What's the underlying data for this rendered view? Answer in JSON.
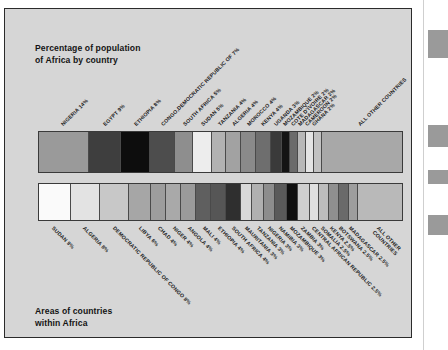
{
  "figure": {
    "top_caption": "Percentage of population\nof Africa by country",
    "bottom_caption": "Areas of countries\nwithin Africa",
    "background_color": "#d6d6d6",
    "border_color": "#2b2b2b"
  },
  "chart_data": [
    {
      "type": "bar",
      "orientation": "horizontal-stacked",
      "title": "Percentage of population of Africa by country",
      "xlabel": "",
      "ylabel": "",
      "label_position": "above-rotated-45",
      "grid": false,
      "legend": "none",
      "total_percent": 100,
      "categories": [
        "NIGERIA",
        "EGYPT",
        "ETHIOPIA",
        "CONGO,DEMOCRATIC REPUBLIC OF",
        "SOUTH AFRICA",
        "SUDAN",
        "TANZANIA",
        "ALGERIA",
        "MOROCCO",
        "KENYA",
        "UGANDA",
        "MOZAMBIQUE",
        "COTE D'IVOIRE",
        "MADAGASCAR",
        "CAMEROON",
        "GHANA",
        "ALL OTHER COUNTRIES"
      ],
      "values": [
        14,
        9,
        8,
        7,
        5,
        5,
        4,
        4,
        4,
        4,
        3,
        2,
        2,
        2,
        2,
        2,
        23
      ],
      "labels": [
        "NIGERIA 14%",
        "EGYPT 9%",
        "ETHIOPIA 8%",
        "CONGO,DEMOCRATIC REPUBLIC OF 7%",
        "SOUTH AFRICA 5%",
        "SUDAN 5%",
        "TANZANIA 4%",
        "ALGERIA 4%",
        "MOROCCO 4%",
        "KENYA 4%",
        "UGANDA 3%",
        "MOZAMBIQUE 2%",
        "COTE D'IVOIRE 2%",
        "MADAGASCAR 2%",
        "CAMEROON 2%",
        "GHANA 2%",
        "ALL OTHER COUNTRIES"
      ],
      "colors": [
        "#9a9a9a",
        "#3e3e3e",
        "#0d0d0d",
        "#4d4d4d",
        "#8e8e8e",
        "#ededed",
        "#b2b2b2",
        "#a2a2a2",
        "#8a8a8a",
        "#6e6e6e",
        "#3a3a3a",
        "#141414",
        "#6b6b6b",
        "#b8b8b8",
        "#e4e4e4",
        "#c2c2c2",
        "#a8a8a8"
      ]
    },
    {
      "type": "bar",
      "orientation": "horizontal-stacked",
      "title": "Areas of countries within Africa",
      "xlabel": "",
      "ylabel": "",
      "label_position": "below-rotated-45",
      "grid": false,
      "legend": "none",
      "total_percent": 100,
      "categories": [
        "SUDAN",
        "ALGERIA",
        "DEMOCRATIC REPUBLIC OF CONGO",
        "LIBYA",
        "CHAD",
        "NIGER",
        "ANGOLA",
        "MALI",
        "ETHIOPIA",
        "SOUTH AFRICA",
        "MAURITANIA",
        "TANZANIA",
        "NIGERIA",
        "NAMIBIA",
        "MOZAMBIQUE",
        "ZAMBIA",
        "CENTRAL AFRICAN REPUBLIC",
        "SOMALIA",
        "KENYA",
        "BOTSWANA",
        "MADAGASCAR",
        "ALL OTHER COUNTRIES"
      ],
      "values": [
        9,
        8,
        8,
        6,
        4,
        4,
        4,
        4,
        4,
        4,
        3,
        3,
        3,
        3,
        3,
        3,
        2.5,
        2.5,
        2.5,
        2.5,
        2.5,
        12.5
      ],
      "labels": [
        "SUDAN 9%",
        "ALGERIA 8%",
        "DEMOCRATIC REPUBLIC OF CONGO 8%",
        "LIBYA 6%",
        "CHAD 4%",
        "NIGER 4%",
        "ANGOLA 4%",
        "MALI 4%",
        "ETHIOPIA 4%",
        "SOUTH AFRICA 4%",
        "MAURITANIA 3%",
        "TANZANIA 3%",
        "NIGERIA 3%",
        "NAMIBIA 3%",
        "MOZAMBIQUE 3%",
        "ZAMBIA 3%",
        "CENTRAL AFRICAN REPUBLIC 2.5%",
        "SOMALIA 2.5%",
        "KENYA 2.5%",
        "BOTSWANA 2.5%",
        "MADAGASCAR 2.5%",
        "ALL OTHER\nCOUNTRIES"
      ],
      "colors": [
        "#fafafa",
        "#e3e3e3",
        "#c8c8c8",
        "#a6a6a6",
        "#9d9d9d",
        "#a9a9a9",
        "#9b9b9b",
        "#5f5f5f",
        "#565656",
        "#2f2f2f",
        "#d9d9d9",
        "#b0b0b0",
        "#8d8d8d",
        "#5a5a5a",
        "#0f0f0f",
        "#cfcfcf",
        "#e0e0e0",
        "#bdbdbd",
        "#8f8f8f",
        "#6a6a6a",
        "#9e9e9e",
        "#b9b9b9"
      ]
    }
  ],
  "right_strip": {
    "blocks": [
      {
        "top": 30,
        "height": 28
      },
      {
        "top": 125,
        "height": 22
      },
      {
        "top": 170,
        "height": 14
      },
      {
        "top": 215,
        "height": 20
      }
    ],
    "color": "#9a9a9a"
  }
}
